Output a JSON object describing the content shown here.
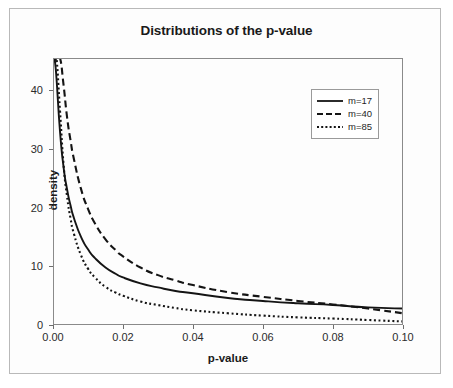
{
  "figure": {
    "title": "Distributions of the p-value"
  },
  "chart_data": {
    "type": "line",
    "title": "Distributions of the p-value",
    "xlabel": "p-value",
    "ylabel": "density",
    "xlim": [
      0.0,
      0.1
    ],
    "ylim": [
      0,
      45.5
    ],
    "grid": false,
    "legend_position": "top-right",
    "xticks": [
      "0.00",
      "0.02",
      "0.04",
      "0.06",
      "0.08",
      "0.10"
    ],
    "xtick_values": [
      0.0,
      0.02,
      0.04,
      0.06,
      0.08,
      0.1
    ],
    "yticks": [
      "0",
      "10",
      "20",
      "30",
      "40"
    ],
    "ytick_values": [
      0,
      10,
      20,
      30,
      40
    ],
    "x": [
      0.0005,
      0.001,
      0.002,
      0.003,
      0.004,
      0.005,
      0.006,
      0.008,
      0.01,
      0.012,
      0.015,
      0.018,
      0.02,
      0.025,
      0.03,
      0.035,
      0.04,
      0.05,
      0.06,
      0.07,
      0.08,
      0.09,
      0.1
    ],
    "series": [
      {
        "name": "m=17",
        "label": "m=17",
        "linestyle": "solid",
        "color": "#141414",
        "values": [
          45.5,
          42.0,
          33.0,
          27.0,
          23.2,
          20.4,
          18.2,
          15.0,
          12.9,
          11.4,
          9.8,
          8.7,
          8.1,
          7.1,
          6.4,
          5.8,
          5.4,
          4.6,
          4.1,
          3.7,
          3.4,
          3.0,
          2.8
        ]
      },
      {
        "name": "m=40",
        "label": "m=40",
        "linestyle": "dashed",
        "color": "#141414",
        "values": [
          45.5,
          45.5,
          45.5,
          41.0,
          35.5,
          31.5,
          28.2,
          23.2,
          19.8,
          17.3,
          14.6,
          12.7,
          11.7,
          9.8,
          8.5,
          7.6,
          6.8,
          5.6,
          4.8,
          4.1,
          3.5,
          2.8,
          2.0
        ]
      },
      {
        "name": "m=85",
        "label": "m=85",
        "linestyle": "dotted",
        "color": "#141414",
        "values": [
          45.5,
          45.5,
          36.5,
          27.5,
          22.0,
          18.2,
          15.5,
          11.9,
          9.6,
          8.1,
          6.5,
          5.5,
          5.0,
          4.0,
          3.4,
          2.9,
          2.5,
          2.0,
          1.6,
          1.3,
          1.1,
          0.85,
          0.6
        ]
      }
    ]
  },
  "legend": {
    "items": [
      {
        "label": "m=17",
        "style": "solid"
      },
      {
        "label": "m=40",
        "style": "dashed"
      },
      {
        "label": "m=85",
        "style": "dotted"
      }
    ]
  },
  "axes": {
    "x_title": "p-value",
    "y_title": "density"
  }
}
